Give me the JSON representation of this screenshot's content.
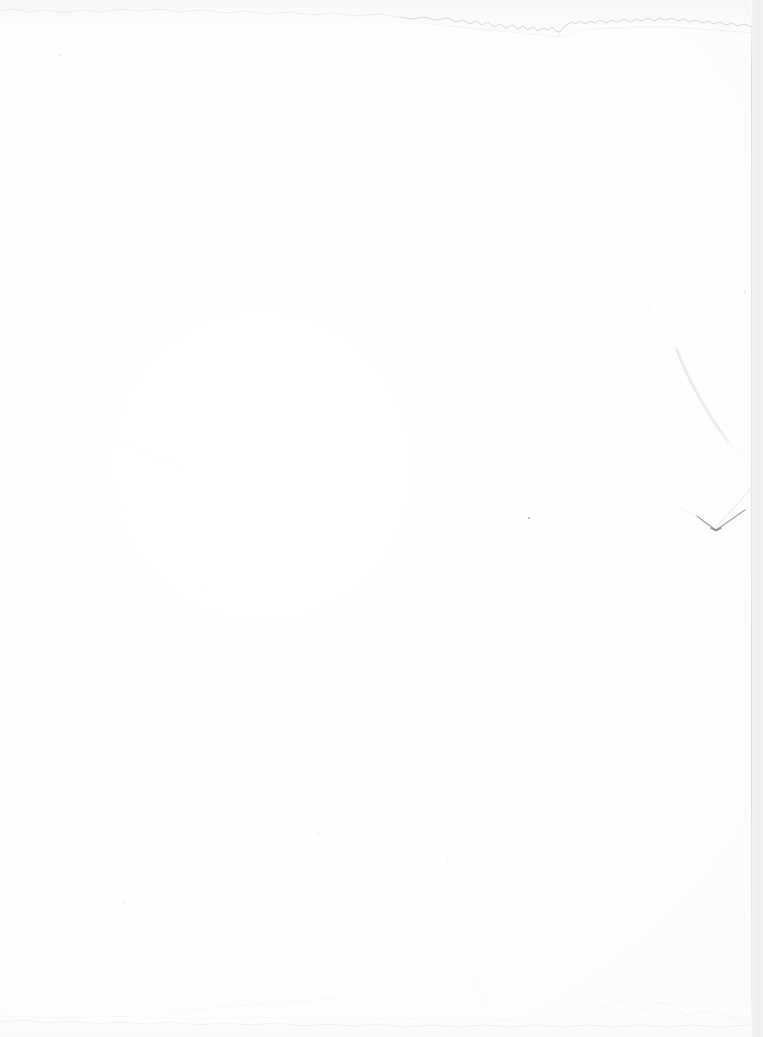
{
  "image": {
    "subject": "blank sheet of white paper",
    "description": "Scan or photograph of an empty unlined white page with a torn top edge, a diagonal crease at the right side ending in a sharp V-shaped notch, and scattered dust specks. No text, no printed content.",
    "width": 763,
    "height": 1037,
    "orientation": "portrait",
    "content_text": ""
  },
  "colors": {
    "paper_white": "#ffffff",
    "paper_shade": "#fafafb",
    "outside_background": "#f0f0f2",
    "edge_line": "#c6c6ce",
    "crease_line": "#d2d2da",
    "notch_dark": "#8e8e99",
    "speck_dark": "#6e6e78"
  },
  "regions": {
    "paper": {
      "name": "paper sheet",
      "left": 0,
      "top": 0,
      "right": 752,
      "bottom": 1037
    },
    "outside_strip": {
      "name": "background beyond right page edge",
      "left": 752,
      "width": 11
    }
  },
  "artifacts": [
    {
      "id": "torn-top-edge",
      "name": "torn top edge",
      "type": "deckled-edge",
      "note": "Jagged wavering line across the top; faint and high on the left (y~8-14), stronger and lower on the right (y~18-32) with a downward spike near x=560."
    },
    {
      "id": "right-page-edge",
      "name": "right page edge",
      "type": "boundary-line",
      "note": "Faint vertical gray boundary at x~752 separating the sheet from the slightly darker background."
    },
    {
      "id": "right-crease",
      "name": "diagonal crease",
      "type": "crease",
      "note": "Soft curved fold line sweeping from about (676,348) down and right toward the page edge."
    },
    {
      "id": "v-notch",
      "name": "v-shaped notch",
      "type": "crease-vertex",
      "note": "Sharpest, darkest mark on the page: a check-mark / V with its vertex near (716,530)."
    },
    {
      "id": "bottom-edge",
      "name": "bottom edge",
      "type": "deckled-edge",
      "note": "Very faint irregular boundary around y~1018 with soft texture toward the right."
    },
    {
      "id": "lower-right-texture",
      "name": "lower right texture",
      "type": "smudge",
      "note": "Faint mottled creasing in the bottom-right quadrant near y~1005-1020."
    }
  ],
  "specks": [
    {
      "name": "dark fleck",
      "x": 529,
      "y": 518,
      "size": 2.2,
      "opacity": 0.55
    },
    {
      "name": "faint smudge",
      "x": 60,
      "y": 55,
      "size": 2.0,
      "opacity": 0.16
    },
    {
      "name": "faint smudge",
      "x": 125,
      "y": 903,
      "size": 2.0,
      "opacity": 0.13
    },
    {
      "name": "faint speck",
      "x": 212,
      "y": 272,
      "size": 1.6,
      "opacity": 0.1
    },
    {
      "name": "faint speck",
      "x": 648,
      "y": 308,
      "size": 1.6,
      "opacity": 0.12
    },
    {
      "name": "faint speck",
      "x": 745,
      "y": 292,
      "size": 1.5,
      "opacity": 0.14
    },
    {
      "name": "faint speck",
      "x": 586,
      "y": 744,
      "size": 1.5,
      "opacity": 0.11
    },
    {
      "name": "faint speck",
      "x": 318,
      "y": 833,
      "size": 1.4,
      "opacity": 0.09
    },
    {
      "name": "faint speck",
      "x": 447,
      "y": 861,
      "size": 1.4,
      "opacity": 0.09
    },
    {
      "name": "faint speck",
      "x": 205,
      "y": 586,
      "size": 1.4,
      "opacity": 0.08
    }
  ]
}
